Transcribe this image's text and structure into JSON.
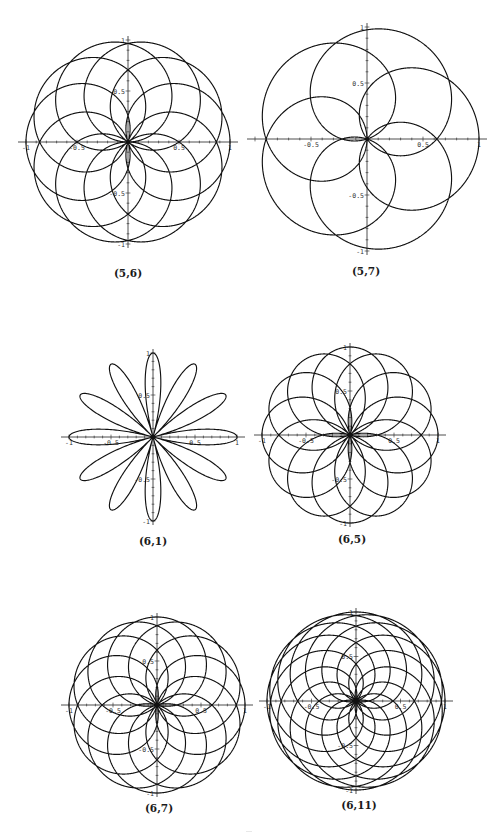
{
  "page": {
    "background": "#ffffff",
    "stroke_color": "#111111"
  },
  "chart_data": [
    {
      "type": "line",
      "subtype": "polar-rose",
      "title": "(5,6)",
      "caption": "(5,6)",
      "params": {
        "p": 5,
        "q": 6
      },
      "center_px": [
        128,
        142
      ],
      "radius_px": 102,
      "xlim": [
        -1,
        1
      ],
      "ylim": [
        -1,
        1
      ],
      "x_tick_labels": [
        "-1",
        "-0.5",
        "0.5",
        "1"
      ],
      "y_tick_labels": [
        "1",
        "0.5",
        "-0.5",
        "-1"
      ],
      "grid": false,
      "legend": null,
      "caption_pos": [
        128,
        274
      ]
    },
    {
      "type": "line",
      "subtype": "polar-rose",
      "title": "(5,7)",
      "caption": "(5,7)",
      "params": {
        "p": 5,
        "q": 7
      },
      "center_px": [
        367,
        139
      ],
      "radius_px": 112,
      "xlim": [
        -1,
        1
      ],
      "ylim": [
        -1,
        1
      ],
      "x_tick_labels": [
        "-0.5",
        "0.5",
        "1"
      ],
      "y_tick_labels": [
        "1",
        "0.5",
        "-0.5",
        "-1"
      ],
      "grid": false,
      "legend": null,
      "caption_pos": [
        366,
        272
      ]
    },
    {
      "type": "line",
      "subtype": "polar-rose",
      "title": "(6,1)",
      "caption": "(6,1)",
      "params": {
        "p": 6,
        "q": 1
      },
      "center_px": [
        153,
        437
      ],
      "radius_px": 84,
      "xlim": [
        -1,
        1
      ],
      "ylim": [
        -1,
        1
      ],
      "x_tick_labels": [
        "-1",
        "-0.5",
        "0.5",
        "1"
      ],
      "y_tick_labels": [
        "1",
        "0.5",
        "-0.5",
        "-1"
      ],
      "grid": false,
      "legend": null,
      "caption_pos": [
        153,
        542
      ]
    },
    {
      "type": "line",
      "subtype": "polar-rose",
      "title": "(6,5)",
      "caption": "(6,5)",
      "params": {
        "p": 6,
        "q": 5
      },
      "center_px": [
        350,
        435
      ],
      "radius_px": 88,
      "xlim": [
        -1,
        1
      ],
      "ylim": [
        -1,
        1
      ],
      "x_tick_labels": [
        "-1",
        "-0.5",
        "0.5",
        "1"
      ],
      "y_tick_labels": [
        "1",
        "0.5",
        "-0.5",
        "-1"
      ],
      "grid": false,
      "legend": null,
      "caption_pos": [
        352,
        540
      ]
    },
    {
      "type": "line",
      "subtype": "polar-rose",
      "title": "(6,7)",
      "caption": "(6,7)",
      "params": {
        "p": 6,
        "q": 7
      },
      "center_px": [
        157,
        705
      ],
      "radius_px": 88,
      "xlim": [
        -1,
        1
      ],
      "ylim": [
        -1,
        1
      ],
      "x_tick_labels": [
        "-1",
        "-0.5",
        "0.5",
        "1"
      ],
      "y_tick_labels": [
        "1",
        "0.5",
        "-0.5",
        "-1"
      ],
      "grid": false,
      "legend": null,
      "caption_pos": [
        159,
        809
      ]
    },
    {
      "type": "line",
      "subtype": "polar-rose",
      "title": "(6,11)",
      "caption": "(6,11)",
      "params": {
        "p": 6,
        "q": 11
      },
      "center_px": [
        356,
        701
      ],
      "radius_px": 89,
      "xlim": [
        -1,
        1
      ],
      "ylim": [
        -1,
        1
      ],
      "x_tick_labels": [
        "-1",
        "-0.5",
        "0.5",
        "1"
      ],
      "y_tick_labels": [
        "1",
        "0.5",
        "-0.5",
        "-1"
      ],
      "grid": false,
      "legend": null,
      "caption_pos": [
        359,
        806
      ]
    }
  ]
}
